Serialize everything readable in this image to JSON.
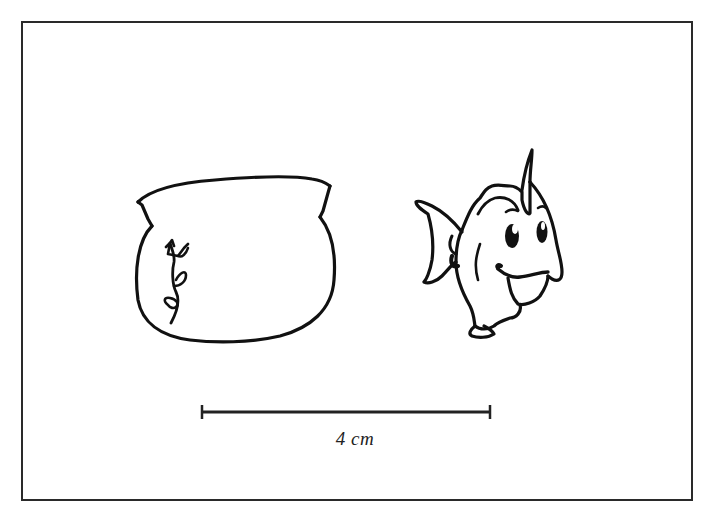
{
  "figure": {
    "objects": [
      {
        "id": "fishbowl",
        "label": "fishbowl"
      },
      {
        "id": "fish",
        "label": "fish"
      }
    ],
    "scale_bar": {
      "label": "4 cm",
      "length_cm": 4
    }
  },
  "colors": {
    "ink": "#111111",
    "frame": "#2a2a2a",
    "background": "#ffffff"
  }
}
